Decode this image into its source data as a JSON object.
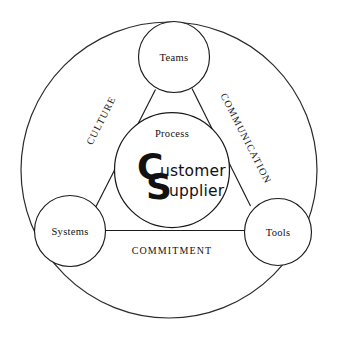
{
  "diagram": {
    "outer_ring": {
      "name": "outer-boundary-circle"
    },
    "center": {
      "process_label": "Process",
      "monogram": {
        "letter_c": "C",
        "letter_s": "S",
        "customer_rest": "ustomer",
        "supplier_rest": "upplier",
        "customer_full": "Customer",
        "supplier_full": "Supplier"
      }
    },
    "nodes": [
      {
        "id": "teams",
        "label": "Teams"
      },
      {
        "id": "systems",
        "label": "Systems"
      },
      {
        "id": "tools",
        "label": "Tools"
      }
    ],
    "edges": [
      {
        "id": "culture",
        "label": "CULTURE",
        "from": "systems",
        "to": "teams"
      },
      {
        "id": "communication",
        "label": "COMMUNICATION",
        "from": "teams",
        "to": "tools"
      },
      {
        "id": "commitment",
        "label": "COMMITMENT",
        "from": "systems",
        "to": "tools"
      }
    ],
    "colors": {
      "stroke": "#1a1a1a",
      "text": "#111111",
      "background": "#ffffff"
    }
  }
}
